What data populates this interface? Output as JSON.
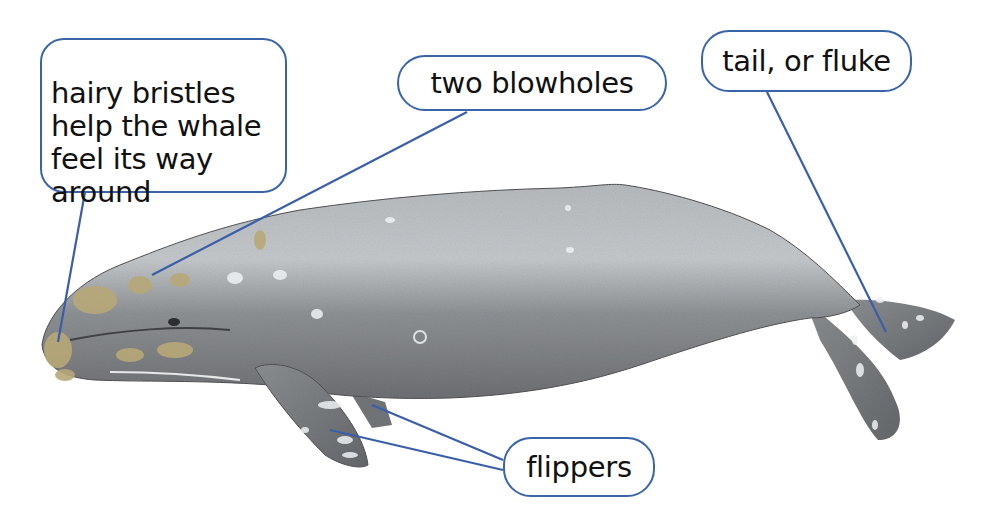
{
  "diagram": {
    "colors": {
      "callout_border": "#3a64a8",
      "leader_line": "#3a5fa8",
      "whale_body": "#8a8d90",
      "whale_light": "#c9cdd0",
      "barnacles": "#b8a878",
      "background": "#ffffff"
    },
    "labels": {
      "bristles": "hairy bristles\nhelp the whale\nfeel its way\naround",
      "blowholes": "two blowholes",
      "tail": "tail, or fluke",
      "flippers": "flippers"
    }
  }
}
